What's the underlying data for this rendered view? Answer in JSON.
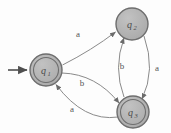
{
  "diagram": {
    "type": "state-transition-diagram",
    "background_color": "#fdfdfd",
    "node_fill_color": "#b3b3b3",
    "node_stroke_color": "#6e6e6e",
    "edge_color": "#8a8a8a",
    "label_color": "#555555",
    "states": [
      {
        "id": "q1",
        "label": "q",
        "subscript": "1",
        "cx": 46,
        "cy": 70,
        "r_outer": 16,
        "r_inner": 12.5,
        "accepting": true,
        "initial": true
      },
      {
        "id": "q2",
        "label": "q",
        "subscript": "2",
        "cx": 132,
        "cy": 24,
        "r_outer": 16,
        "r_inner": 12.5,
        "accepting": false,
        "initial": false
      },
      {
        "id": "q3",
        "label": "q",
        "subscript": "3",
        "cx": 133,
        "cy": 112,
        "r_outer": 16,
        "r_inner": 12.5,
        "accepting": true,
        "initial": false
      }
    ],
    "transitions": [
      {
        "from": "q1",
        "to": "q2",
        "symbol": "a",
        "label_x": 78,
        "label_y": 37
      },
      {
        "from": "q1",
        "to": "q3",
        "symbol": "b",
        "label_x": 82,
        "label_y": 86
      },
      {
        "from": "q3",
        "to": "q1",
        "symbol": "a",
        "label_x": 72,
        "label_y": 110
      },
      {
        "from": "q2",
        "to": "q3",
        "symbol": "a",
        "label_x": 157,
        "label_y": 71
      },
      {
        "from": "q3",
        "to": "q2",
        "symbol": "b",
        "label_x": 123,
        "label_y": 69
      }
    ],
    "start_arrow": {
      "name": "start-arrow",
      "x1": 8,
      "y1": 70,
      "x2": 29,
      "y2": 70
    }
  }
}
